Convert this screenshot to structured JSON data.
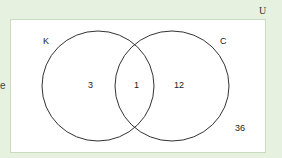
{
  "diagram": {
    "type": "venn",
    "universe_label": "U",
    "sets": [
      {
        "name": "K",
        "only": 3
      },
      {
        "name": "C",
        "only": 12
      }
    ],
    "intersection": 1,
    "outside": 36,
    "clipped_left_text": "e"
  }
}
